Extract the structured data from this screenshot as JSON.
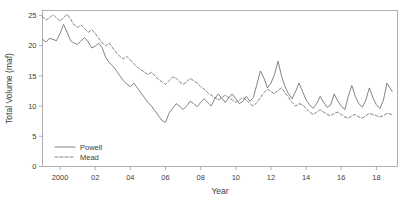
{
  "chart_data": {
    "type": "line",
    "title": "",
    "xlabel": "Year",
    "ylabel": "Total Volume (maf)",
    "xlim": [
      1999.0,
      2019.2
    ],
    "ylim": [
      0,
      25.8
    ],
    "grid": false,
    "legend_position": "bottom-left",
    "xticks": [
      2000,
      2002,
      2004,
      2006,
      2008,
      2010,
      2012,
      2014,
      2016,
      2018
    ],
    "xtick_labels": [
      "2000",
      "02",
      "04",
      "06",
      "08",
      "10",
      "12",
      "14",
      "16",
      "18"
    ],
    "yticks": [
      0,
      5,
      10,
      15,
      20,
      25
    ],
    "ytick_labels": [
      "0",
      "5",
      "10",
      "15",
      "20",
      "25"
    ],
    "series": [
      {
        "name": "Powell",
        "style": "solid",
        "color": "#5a5a5a",
        "x": [
          1999.0,
          1999.2,
          1999.4,
          1999.6,
          1999.8,
          2000.0,
          2000.2,
          2000.4,
          2000.6,
          2000.8,
          2001.0,
          2001.2,
          2001.4,
          2001.6,
          2001.8,
          2002.0,
          2002.2,
          2002.4,
          2002.6,
          2002.8,
          2003.0,
          2003.2,
          2003.4,
          2003.6,
          2003.8,
          2004.0,
          2004.2,
          2004.4,
          2004.6,
          2004.8,
          2005.0,
          2005.2,
          2005.4,
          2005.6,
          2005.8,
          2006.0,
          2006.2,
          2006.4,
          2006.6,
          2006.8,
          2007.0,
          2007.2,
          2007.4,
          2007.6,
          2007.8,
          2008.0,
          2008.2,
          2008.4,
          2008.6,
          2008.8,
          2009.0,
          2009.2,
          2009.4,
          2009.6,
          2009.8,
          2010.0,
          2010.2,
          2010.4,
          2010.6,
          2010.8,
          2011.0,
          2011.2,
          2011.4,
          2011.6,
          2011.8,
          2012.0,
          2012.2,
          2012.4,
          2012.6,
          2012.8,
          2013.0,
          2013.2,
          2013.4,
          2013.6,
          2013.8,
          2014.0,
          2014.2,
          2014.4,
          2014.6,
          2014.8,
          2015.0,
          2015.2,
          2015.4,
          2015.6,
          2015.8,
          2016.0,
          2016.2,
          2016.4,
          2016.6,
          2016.8,
          2017.0,
          2017.2,
          2017.4,
          2017.6,
          2017.8,
          2018.0,
          2018.2,
          2018.4,
          2018.6,
          2018.9
        ],
        "y": [
          21.0,
          20.6,
          21.2,
          21.0,
          20.8,
          22.0,
          23.5,
          22.2,
          20.8,
          20.4,
          20.2,
          20.8,
          21.3,
          20.6,
          19.6,
          19.9,
          20.4,
          19.6,
          18.0,
          17.2,
          16.6,
          15.9,
          15.0,
          14.2,
          13.6,
          13.2,
          13.8,
          13.0,
          12.2,
          11.4,
          10.6,
          10.0,
          9.2,
          8.4,
          7.6,
          7.3,
          8.8,
          9.6,
          10.4,
          10.0,
          9.4,
          10.0,
          10.8,
          10.4,
          9.9,
          10.6,
          11.2,
          10.6,
          10.0,
          11.2,
          12.0,
          11.3,
          10.6,
          11.4,
          12.0,
          11.2,
          10.4,
          10.8,
          11.6,
          10.8,
          11.4,
          13.6,
          15.8,
          14.6,
          13.0,
          13.8,
          15.2,
          17.4,
          15.0,
          13.2,
          12.0,
          11.2,
          12.4,
          13.8,
          12.4,
          11.0,
          10.2,
          9.6,
          10.4,
          11.6,
          10.6,
          9.8,
          10.2,
          12.0,
          10.8,
          10.0,
          9.4,
          11.6,
          13.4,
          11.6,
          10.4,
          9.8,
          11.0,
          13.0,
          11.4,
          10.2,
          9.6,
          11.0,
          13.8,
          12.4
        ]
      },
      {
        "name": "Mead",
        "style": "dashed",
        "color": "#5a5a5a",
        "x": [
          1999.0,
          1999.2,
          1999.4,
          1999.6,
          1999.8,
          2000.0,
          2000.2,
          2000.4,
          2000.6,
          2000.8,
          2001.0,
          2001.2,
          2001.4,
          2001.6,
          2001.8,
          2002.0,
          2002.2,
          2002.4,
          2002.6,
          2002.8,
          2003.0,
          2003.2,
          2003.4,
          2003.6,
          2003.8,
          2004.0,
          2004.2,
          2004.4,
          2004.6,
          2004.8,
          2005.0,
          2005.2,
          2005.4,
          2005.6,
          2005.8,
          2006.0,
          2006.2,
          2006.4,
          2006.6,
          2006.8,
          2007.0,
          2007.2,
          2007.4,
          2007.6,
          2007.8,
          2008.0,
          2008.2,
          2008.4,
          2008.6,
          2008.8,
          2009.0,
          2009.2,
          2009.4,
          2009.6,
          2009.8,
          2010.0,
          2010.2,
          2010.4,
          2010.6,
          2010.8,
          2011.0,
          2011.2,
          2011.4,
          2011.6,
          2011.8,
          2012.0,
          2012.2,
          2012.4,
          2012.6,
          2012.8,
          2013.0,
          2013.2,
          2013.4,
          2013.6,
          2013.8,
          2014.0,
          2014.2,
          2014.4,
          2014.6,
          2014.8,
          2015.0,
          2015.2,
          2015.4,
          2015.6,
          2015.8,
          2016.0,
          2016.2,
          2016.4,
          2016.6,
          2016.8,
          2017.0,
          2017.2,
          2017.4,
          2017.6,
          2017.8,
          2018.0,
          2018.2,
          2018.4,
          2018.6,
          2018.9
        ],
        "y": [
          24.8,
          24.2,
          24.6,
          25.1,
          24.6,
          24.0,
          24.6,
          25.2,
          24.4,
          23.4,
          23.0,
          23.4,
          22.8,
          22.2,
          22.6,
          22.0,
          21.2,
          20.4,
          20.0,
          20.4,
          19.6,
          18.8,
          18.2,
          17.8,
          18.2,
          17.6,
          17.0,
          16.4,
          16.0,
          15.6,
          15.2,
          15.6,
          15.0,
          14.4,
          14.0,
          13.6,
          14.2,
          14.8,
          14.6,
          14.0,
          13.6,
          14.0,
          14.6,
          14.2,
          13.8,
          13.2,
          12.8,
          12.2,
          11.8,
          11.4,
          11.0,
          11.4,
          11.8,
          11.4,
          11.0,
          10.6,
          11.0,
          11.4,
          11.0,
          10.4,
          10.0,
          10.6,
          11.4,
          12.2,
          12.8,
          12.4,
          12.0,
          12.6,
          13.0,
          12.2,
          11.4,
          10.6,
          10.0,
          10.4,
          10.2,
          9.6,
          9.0,
          8.6,
          9.0,
          9.4,
          9.0,
          8.6,
          8.4,
          8.8,
          9.0,
          8.6,
          8.2,
          8.0,
          8.4,
          8.6,
          8.2,
          8.0,
          8.4,
          8.8,
          8.6,
          8.4,
          8.2,
          8.4,
          8.8,
          8.6
        ]
      }
    ]
  },
  "legend": {
    "items": [
      {
        "label": "Powell",
        "style": "solid"
      },
      {
        "label": "Mead",
        "style": "dashed"
      }
    ]
  }
}
